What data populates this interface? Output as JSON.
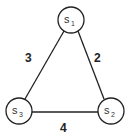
{
  "diagram": {
    "type": "weighted-graph",
    "nodes": [
      {
        "id": "s1",
        "label": "s",
        "subscript": "1"
      },
      {
        "id": "s2",
        "label": "s",
        "subscript": "2"
      },
      {
        "id": "s3",
        "label": "s",
        "subscript": "3"
      }
    ],
    "edges": [
      {
        "from": "s1",
        "to": "s3",
        "weight": "3"
      },
      {
        "from": "s1",
        "to": "s2",
        "weight": "2"
      },
      {
        "from": "s3",
        "to": "s2",
        "weight": "4"
      }
    ]
  }
}
